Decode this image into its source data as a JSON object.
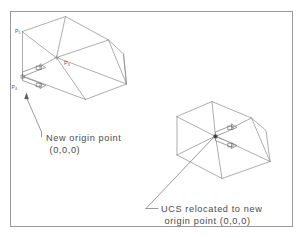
{
  "figure": {
    "background_color": "#ffffff",
    "line_color": "#8a8a8a",
    "text_color": "#4a4a4a",
    "frame": {
      "x": 10,
      "y": 11,
      "width": 283,
      "height": 216
    }
  },
  "labels": {
    "p5": {
      "base": "P",
      "sub": "5"
    },
    "p3": {
      "base": "P",
      "sub": "3"
    },
    "p4": {
      "base": "P",
      "sub": "4"
    }
  },
  "annotations": {
    "left": {
      "line1": "New origin point",
      "line2": "(0,0,0)"
    },
    "right": {
      "line1": "UCS relocated to new",
      "line2": "origin point (0,0,0)"
    }
  },
  "shapes": {
    "left_solid": {
      "name": "wedge-solid-before",
      "description": "isometric wedge / truncated prism with UCS icon at lower-left corner"
    },
    "right_solid": {
      "name": "wedge-solid-after",
      "description": "isometric wedge / truncated prism with UCS icon relocated to new origin"
    }
  },
  "ucs_icons": {
    "left": {
      "name": "ucs-icon-original",
      "axes": [
        "X",
        "Y"
      ]
    },
    "right": {
      "name": "ucs-icon-relocated",
      "axes": [
        "X",
        "Y"
      ]
    }
  }
}
